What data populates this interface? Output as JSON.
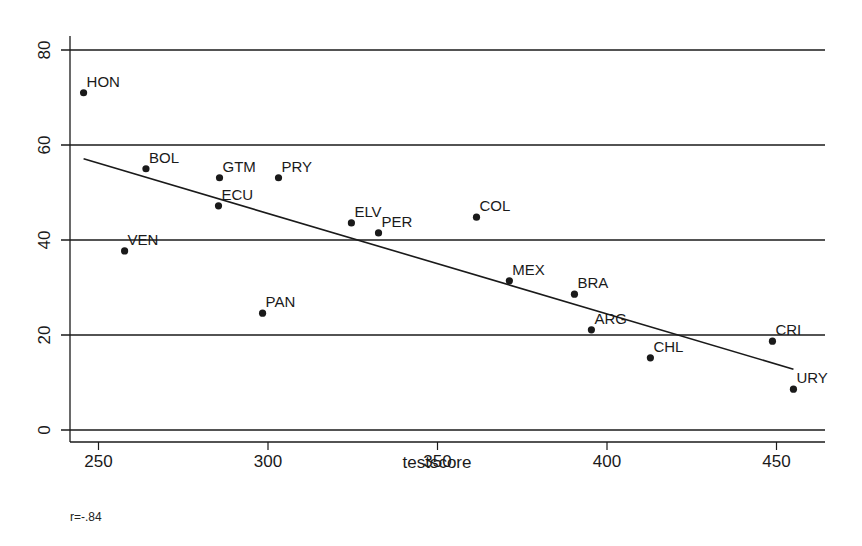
{
  "chart_data": {
    "type": "scatter",
    "title": "",
    "xlabel": "testscore",
    "ylabel": "",
    "xlim": [
      242,
      465
    ],
    "ylim": [
      -2.5,
      82
    ],
    "x_ticks": [
      250,
      300,
      350,
      400,
      450
    ],
    "y_ticks": [
      0,
      20,
      40,
      60,
      80
    ],
    "grid": {
      "horizontal": true,
      "vertical": false
    },
    "legend": null,
    "annotation": "r=-.84",
    "points": [
      {
        "label": "HON",
        "x": 245.6,
        "y": 71.0
      },
      {
        "label": "BOL",
        "x": 264.0,
        "y": 55.0
      },
      {
        "label": "GTM",
        "x": 285.7,
        "y": 53.1
      },
      {
        "label": "PRY",
        "x": 303.1,
        "y": 53.1
      },
      {
        "label": "ECU",
        "x": 285.4,
        "y": 47.2
      },
      {
        "label": "VEN",
        "x": 257.7,
        "y": 37.7
      },
      {
        "label": "PAN",
        "x": 298.4,
        "y": 24.6
      },
      {
        "label": "ELV",
        "x": 324.6,
        "y": 43.6
      },
      {
        "label": "PER",
        "x": 332.6,
        "y": 41.5
      },
      {
        "label": "COL",
        "x": 361.5,
        "y": 44.8
      },
      {
        "label": "MEX",
        "x": 371.2,
        "y": 31.4
      },
      {
        "label": "BRA",
        "x": 390.4,
        "y": 28.6
      },
      {
        "label": "ARG",
        "x": 395.4,
        "y": 21.1
      },
      {
        "label": "CHL",
        "x": 412.8,
        "y": 15.2
      },
      {
        "label": "CRI",
        "x": 448.8,
        "y": 18.7
      },
      {
        "label": "URY",
        "x": 455.0,
        "y": 8.6
      }
    ],
    "fit_line": {
      "type": "linear",
      "x": [
        245.6,
        455.0
      ],
      "y": [
        57.1,
        12.8
      ]
    }
  },
  "footer": {
    "note": "r=-.84"
  },
  "colors": {
    "ink": "#1a1a1a",
    "background": "#ffffff"
  }
}
